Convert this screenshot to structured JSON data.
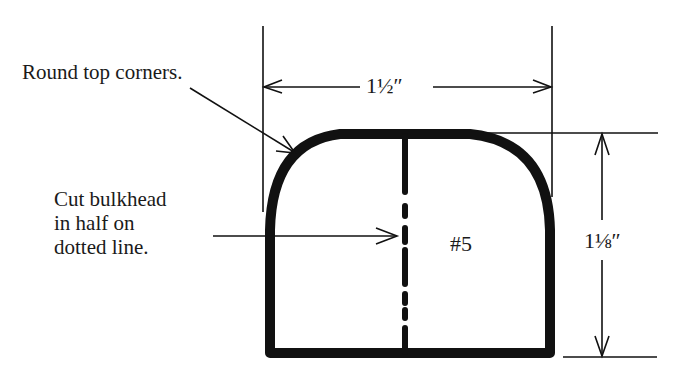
{
  "diagram": {
    "type": "template-pattern",
    "part_label": "#5",
    "annotations": {
      "round_corners": "Round top corners.",
      "cut_line_1": "Cut bulkhead",
      "cut_line_2": "in half on",
      "cut_line_3": "dotted line."
    },
    "dimensions": {
      "width": "1½″",
      "height": "1⅛″"
    },
    "colors": {
      "ink": "#111111",
      "background": "#ffffff"
    }
  }
}
